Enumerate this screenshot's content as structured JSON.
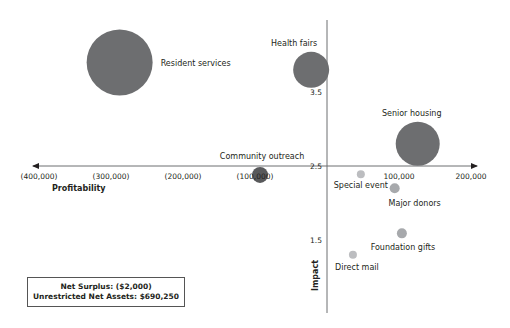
{
  "chart_data": {
    "type": "bubble",
    "title": "",
    "xlabel": "Profitability",
    "ylabel": "Impact",
    "xlim": [
      -400000,
      200000
    ],
    "ylim": [
      0.8,
      4.2
    ],
    "x_ticks": [
      {
        "value": -400000,
        "label": "(400,000)"
      },
      {
        "value": -300000,
        "label": "(300,000)"
      },
      {
        "value": -200000,
        "label": "(200,000)"
      },
      {
        "value": -100000,
        "label": "(100,000)"
      },
      {
        "value": 100000,
        "label": "100,000"
      },
      {
        "value": 200000,
        "label": "200,000"
      }
    ],
    "y_ticks": [
      {
        "value": 1.5,
        "label": "1.5"
      },
      {
        "value": 2.5,
        "label": "2.5"
      },
      {
        "value": 3.5,
        "label": "3.5"
      }
    ],
    "axis_cross": {
      "x": 0,
      "y": 2.5
    },
    "grid": false,
    "legend": "none",
    "points": [
      {
        "name": "Resident services",
        "x": -288000,
        "y": 3.9,
        "radius": 33,
        "color": "#6d6e70"
      },
      {
        "name": "Health fairs",
        "x": -22000,
        "y": 3.8,
        "radius": 18,
        "color": "#6d6e70"
      },
      {
        "name": "Senior housing",
        "x": 126000,
        "y": 2.8,
        "radius": 22,
        "color": "#6d6e70"
      },
      {
        "name": "Community outreach",
        "x": -93000,
        "y": 2.38,
        "radius": 8,
        "color": "#58595b"
      },
      {
        "name": "Special event",
        "x": 47000,
        "y": 2.39,
        "radius": 4,
        "color": "#bcbdc0"
      },
      {
        "name": "Major donors",
        "x": 94000,
        "y": 2.2,
        "radius": 5,
        "color": "#a7a9ac"
      },
      {
        "name": "Foundation gifts",
        "x": 104000,
        "y": 1.59,
        "radius": 5,
        "color": "#a7a9ac"
      },
      {
        "name": "Direct mail",
        "x": 36000,
        "y": 1.3,
        "radius": 4,
        "color": "#bcbdc0"
      }
    ]
  },
  "summary": {
    "net_surplus": "Net Surplus: ($2,000)",
    "unrestricted_net_assets": "Unrestricted Net Assets: $690,250"
  }
}
